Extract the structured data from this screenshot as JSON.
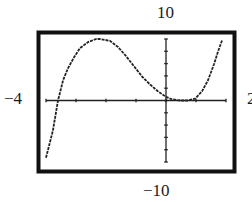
{
  "window": {
    "xmin": -4,
    "xmax": 2,
    "ymin": -10,
    "ymax": 10,
    "labels": {
      "xmin": "−4",
      "xmax": "2",
      "ymin": "−10",
      "ymax": "10"
    }
  },
  "colors": {
    "frame": "#111111",
    "axis": "#222222",
    "curve": "#222222",
    "background": "#ffffff"
  },
  "chart_data": {
    "type": "line",
    "title": "",
    "xlabel": "",
    "ylabel": "",
    "xlim": [
      -4,
      2
    ],
    "ylim": [
      -10,
      10
    ],
    "xscale_tick": 1,
    "yscale_tick": 2,
    "grid": false,
    "legend": null,
    "series": [
      {
        "name": "f(x)",
        "style": "dashed (calculator pixel plot)",
        "x": [
          -4.0,
          -3.9,
          -3.77,
          -3.6,
          -3.43,
          -3.27,
          -3.07,
          -2.87,
          -2.6,
          -2.33,
          -2.2,
          -1.87,
          -1.6,
          -1.33,
          -1.07,
          -0.8,
          -0.53,
          -0.27,
          0.0,
          0.2,
          0.47,
          0.73,
          0.97,
          1.2,
          1.4,
          1.6,
          1.73,
          1.87
        ],
        "y": [
          -9.3,
          -7.4,
          -4.9,
          0.0,
          3.3,
          5.2,
          7.0,
          8.5,
          9.5,
          10.0,
          10.0,
          9.7,
          8.7,
          7.2,
          5.6,
          3.9,
          2.6,
          1.5,
          0.6,
          0.2,
          0.0,
          0.0,
          0.3,
          1.5,
          3.3,
          5.9,
          7.9,
          9.8
        ]
      }
    ],
    "annotations": [
      {
        "text": "10",
        "position": "top (ymax)"
      },
      {
        "text": "−10",
        "position": "bottom (ymin)"
      },
      {
        "text": "−4",
        "position": "left (xmin)"
      },
      {
        "text": "2",
        "position": "right (xmax, partially cut off)"
      }
    ]
  }
}
